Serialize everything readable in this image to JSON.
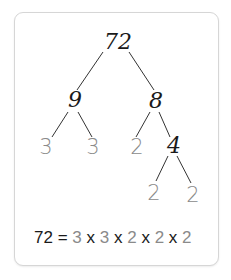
{
  "tree": {
    "root": "72",
    "level1": [
      "9",
      "8"
    ],
    "level2": [
      "3",
      "3",
      "2",
      "4"
    ],
    "level3": [
      "2",
      "2"
    ]
  },
  "equation": {
    "lhs": "72",
    "equals": "=",
    "factors": [
      "3",
      "3",
      "2",
      "2",
      "2"
    ],
    "operator": "x"
  },
  "colors": {
    "composite": "#1a1a1a",
    "prime": "#8a8a8a",
    "line": "#333333"
  }
}
